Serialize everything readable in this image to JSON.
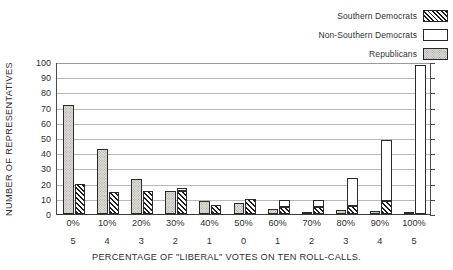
{
  "legend": {
    "items": [
      {
        "label": "Southern Democrats",
        "swatch": "hatch-swatch-icon",
        "color": "#1e1e1e"
      },
      {
        "label": "Non-Southern Democrats",
        "swatch": "white-swatch-icon",
        "color": "#ffffff"
      },
      {
        "label": "Republicans",
        "swatch": "stipple-swatch-icon",
        "color": "#dedcd7"
      }
    ]
  },
  "axes": {
    "ylabel": "NUMBER OF REPRESENTATIVES",
    "xlabel": "PERCENTAGE OF \"LIBERAL\" VOTES ON TEN ROLL-CALLS.",
    "yticks": [
      "0",
      "10",
      "20",
      "30",
      "40",
      "50",
      "60",
      "70",
      "80",
      "90",
      "100"
    ],
    "xticks_percent": [
      "0%",
      "10%",
      "20%",
      "30%",
      "40%",
      "50%",
      "60%",
      "70%",
      "80%",
      "90%",
      "100%"
    ],
    "xticks_count": [
      "5",
      "4",
      "3",
      "2",
      "1",
      "0",
      "1",
      "2",
      "3",
      "4",
      "5"
    ]
  },
  "chart_data": {
    "type": "bar",
    "title": "",
    "xlabel": "PERCENTAGE OF \"LIBERAL\" VOTES ON TEN ROLL-CALLS.",
    "ylabel": "NUMBER OF REPRESENTATIVES",
    "ylim": [
      0,
      100
    ],
    "ytick_step": 10,
    "grid": true,
    "grid_axis": "y",
    "legend_position": "top-right",
    "categories": [
      "0%",
      "10%",
      "20%",
      "30%",
      "40%",
      "50%",
      "60%",
      "70%",
      "80%",
      "90%",
      "100%"
    ],
    "secondary_categories": [
      "5",
      "4",
      "3",
      "2",
      "1",
      "0",
      "1",
      "2",
      "3",
      "4",
      "5"
    ],
    "series": [
      {
        "name": "Republicans",
        "pattern": "stipple",
        "values": [
          72,
          43,
          23,
          15,
          8.5,
          7.5,
          3,
          1.5,
          2.5,
          2,
          1.5
        ]
      },
      {
        "name": "Southern Democrats",
        "pattern": "diagonal-hatch",
        "values": [
          20,
          14.5,
          15,
          15,
          6,
          10,
          4.5,
          4.5,
          5,
          8.5,
          0
        ]
      },
      {
        "name": "Non-Southern Democrats",
        "pattern": "white",
        "note": "stacked on top of Southern Democrats bar",
        "values": [
          0,
          0,
          0,
          2,
          0,
          0,
          4.5,
          4.5,
          19,
          40,
          98
        ]
      }
    ]
  }
}
